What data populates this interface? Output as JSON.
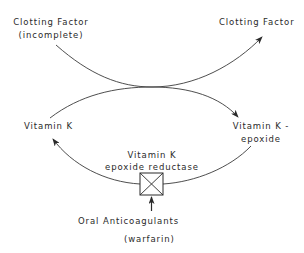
{
  "diagram": {
    "labels": {
      "clotting_factor_incomplete_line1": "Clotting Factor",
      "clotting_factor_incomplete_line2": "(incomplete)",
      "clotting_factor": "Clotting Factor",
      "vitamin_k": "Vitamin K",
      "vitamin_k_epoxide_line1": "Vitamin K -",
      "vitamin_k_epoxide_line2": "epoxide",
      "enzyme_line1": "Vitamin K",
      "enzyme_line2": "epoxide reductase",
      "inhibitor_line1": "Oral  Anticoagulants",
      "inhibitor_line2": "(warfarin)"
    },
    "nodes": [
      {
        "id": "clotting-factor-incomplete",
        "label": "Clotting Factor (incomplete)"
      },
      {
        "id": "clotting-factor",
        "label": "Clotting Factor"
      },
      {
        "id": "vitamin-k",
        "label": "Vitamin K"
      },
      {
        "id": "vitamin-k-epoxide",
        "label": "Vitamin K - epoxide"
      },
      {
        "id": "enzyme",
        "label": "Vitamin K epoxide reductase"
      },
      {
        "id": "inhibitor",
        "label": "Oral Anticoagulants (warfarin)"
      }
    ],
    "edges": [
      {
        "from": "clotting-factor-incomplete",
        "to": "clotting-factor"
      },
      {
        "from": "vitamin-k",
        "to": "vitamin-k-epoxide"
      },
      {
        "from": "vitamin-k-epoxide",
        "to": "vitamin-k",
        "via": "enzyme"
      },
      {
        "from": "inhibitor",
        "to": "enzyme",
        "type": "inhibits"
      }
    ],
    "colors": {
      "line": "#3a3a3a",
      "text": "#2a2a2a",
      "background": "#ffffff"
    }
  }
}
